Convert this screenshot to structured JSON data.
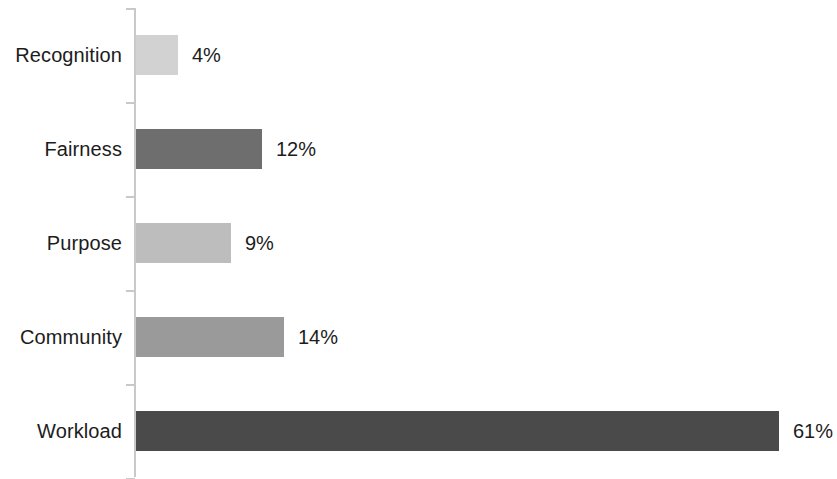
{
  "chart_data": {
    "type": "bar",
    "orientation": "horizontal",
    "title": "",
    "subtitle": "",
    "xlabel": "",
    "ylabel": "",
    "categories": [
      "Recognition",
      "Fairness",
      "Purpose",
      "Community",
      "Workload"
    ],
    "values": [
      4,
      12,
      9,
      14,
      61
    ],
    "value_labels": [
      "4%",
      "12%",
      "9%",
      "14%",
      "61%"
    ],
    "value_suffix": "%",
    "xlim": [
      0,
      61
    ],
    "grid": false,
    "legend": null,
    "legend_position": "none",
    "bar_colors": [
      "#d2d2d2",
      "#6e6e6e",
      "#bdbdbd",
      "#9a9a9a",
      "#4a4a4a"
    ],
    "axis_color": "#c9c9c9",
    "text_color": "#1c1c1c",
    "background": "#ffffff",
    "bars": [
      {
        "category": "Recognition",
        "value": 4,
        "label": "4%",
        "color": "#d2d2d2"
      },
      {
        "category": "Fairness",
        "value": 12,
        "label": "12%",
        "color": "#6e6e6e"
      },
      {
        "category": "Purpose",
        "value": 9,
        "label": "9%",
        "color": "#bdbdbd"
      },
      {
        "category": "Community",
        "value": 14,
        "label": "14%",
        "color": "#9a9a9a"
      },
      {
        "category": "Workload",
        "value": 61,
        "label": "61%",
        "color": "#4a4a4a"
      }
    ]
  }
}
